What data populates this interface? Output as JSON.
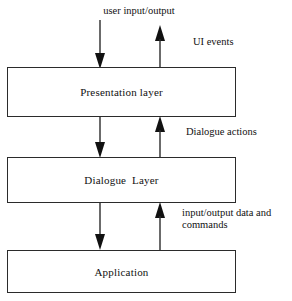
{
  "diagram": {
    "background_color": "#ffffff",
    "line_color": "#2b2b2b",
    "text_color": "#111111",
    "boxes": [
      {
        "id": "presentation",
        "label": "Presentation layer"
      },
      {
        "id": "dialogue",
        "label": "Dialogue  Layer"
      },
      {
        "id": "application",
        "label": "Application"
      }
    ],
    "edge_labels": {
      "user_io": "user input/output",
      "ui_events": "UI events",
      "dialogue_actions": "Dialogue actions",
      "io_data_commands": "input/output data and\ncommands"
    },
    "arrows": [
      {
        "id": "user-input-down",
        "direction": "down",
        "from": "user input/output",
        "to": "Presentation layer"
      },
      {
        "id": "ui-events-up",
        "direction": "up",
        "from": "Presentation layer",
        "to": "user input/output"
      },
      {
        "id": "presentation-to-dialogue-down",
        "direction": "down",
        "from": "Presentation layer",
        "to": "Dialogue  Layer"
      },
      {
        "id": "dialogue-to-presentation-up",
        "direction": "up",
        "from": "Dialogue  Layer",
        "to": "Presentation layer"
      },
      {
        "id": "dialogue-to-application-down",
        "direction": "down",
        "from": "Dialogue  Layer",
        "to": "Application"
      },
      {
        "id": "application-to-dialogue-up",
        "direction": "up",
        "from": "Application",
        "to": "Dialogue  Layer"
      }
    ]
  }
}
